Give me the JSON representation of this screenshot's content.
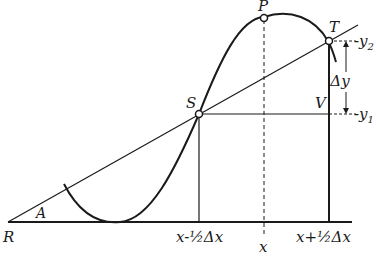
{
  "diagram": {
    "points": {
      "R": "R",
      "A": "A",
      "S": "S",
      "T": "T",
      "P": "P",
      "V": "V"
    },
    "axis_labels": {
      "left": "x-½Δx",
      "center": "x",
      "right": "x+½Δx"
    },
    "y_labels": {
      "y2": "-y",
      "y2_sub": "2",
      "y1": "-y",
      "y1_sub": "1",
      "delta_y": "Δy"
    },
    "colors": {
      "ink": "#1a1a1a",
      "background": "#ffffff"
    }
  }
}
